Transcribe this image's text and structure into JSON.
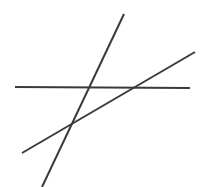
{
  "figure": {
    "background_color": "#ffffff",
    "width": 210,
    "height": 187,
    "line_color": "#3a3a3a"
  },
  "chart_data": {
    "type": "line",
    "subtitle": "",
    "xlabel": "",
    "ylabel": "",
    "xlim": [
      0,
      210
    ],
    "ylim": [
      0,
      187
    ],
    "grid": false,
    "legend": "none",
    "axes_visible": false,
    "tick_labels": [],
    "annotations": [],
    "series": [
      {
        "name": "horizontal-line",
        "description": "Nearly flat line spanning the width of the figure",
        "color": "#3a3a3a",
        "stroke_width": 2.0,
        "x": [
          15,
          190
        ],
        "y": [
          87,
          88
        ],
        "slope": 0.006
      },
      {
        "name": "steep-line",
        "description": "Steeply descending line from upper right to lower left",
        "color": "#3a3a3a",
        "stroke_width": 2.0,
        "x": [
          124,
          42
        ],
        "y": [
          14,
          187
        ],
        "slope": -2.11
      },
      {
        "name": "shallow-line",
        "description": "Gently rising line from lower left to upper right",
        "color": "#3a3a3a",
        "stroke_width": 2.0,
        "x": [
          22,
          195
        ],
        "y": [
          153,
          52
        ],
        "slope": -0.584
      }
    ],
    "intersections": [
      {
        "name": "horizontal-steep",
        "x": 88,
        "y": 87
      },
      {
        "name": "horizontal-shallow",
        "x": 136,
        "y": 87
      },
      {
        "name": "steep-shallow",
        "x": 71,
        "y": 124
      }
    ]
  }
}
